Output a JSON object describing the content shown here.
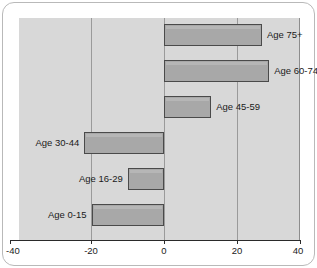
{
  "chart_data": {
    "type": "bar",
    "orientation": "horizontal",
    "title": "",
    "subtitle": "",
    "xlabel": "",
    "ylabel": "",
    "xlim": [
      -40,
      40
    ],
    "xticks": [
      -40,
      -20,
      0,
      20,
      40
    ],
    "xtick_labels": [
      "-40",
      "-20",
      "0",
      "20",
      "40"
    ],
    "grid": true,
    "gridlines_at": [
      -20,
      0,
      20
    ],
    "legend": "none",
    "zero_reference_line": 0,
    "categories": [
      "Age 75+",
      "Age 60-74",
      "Age 45-59",
      "Age 30-44",
      "Age 16-29",
      "Age 0-15"
    ],
    "values": [
      27,
      29,
      13,
      -22,
      -10,
      -20
    ],
    "bars": [
      {
        "label": "Age 75+",
        "value": 27,
        "label_side": "right"
      },
      {
        "label": "Age 60-74",
        "value": 29,
        "label_side": "right"
      },
      {
        "label": "Age 45-59",
        "value": 13,
        "label_side": "right"
      },
      {
        "label": "Age 30-44",
        "value": -22,
        "label_side": "left"
      },
      {
        "label": "Age 16-29",
        "value": -10,
        "label_side": "left"
      },
      {
        "label": "Age 0-15",
        "value": -20,
        "label_side": "left"
      }
    ],
    "colors": {
      "plot_background": "#d8d8d8",
      "bar_fill": "#a8a8a8",
      "bar_edge": "#4a4a4a",
      "gridline": "#9a9a9a",
      "axis": "#2a2a2a",
      "text": "#1a1a1a",
      "figure_background": "#ffffff"
    }
  }
}
